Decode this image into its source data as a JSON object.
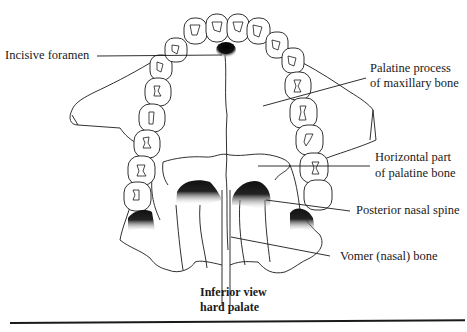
{
  "figure": {
    "caption_line1": "Inferior view",
    "caption_line2": "hard palate",
    "labels": {
      "incisive_foramen": "Incisive foramen",
      "palatine_process_line1": "Palatine process",
      "palatine_process_line2": "of maxillary bone",
      "horizontal_part_line1": "Horizontal part",
      "horizontal_part_line2": "of palatine bone",
      "posterior_nasal_spine": "Posterior nasal spine",
      "vomer": "Vomer (nasal) bone"
    },
    "colors": {
      "ink": "#1a1a1a",
      "background": "#ffffff"
    }
  }
}
